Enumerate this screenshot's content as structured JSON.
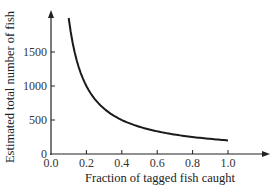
{
  "chart_data": {
    "type": "line",
    "title": "",
    "xlabel": "Fraction of tagged fish caught",
    "ylabel": "Estimated total number of fish",
    "xlim": [
      0.0,
      1.0
    ],
    "ylim": [
      0,
      2000
    ],
    "x_ticks": [
      "0.0",
      "0.2",
      "0.4",
      "0.6",
      "0.8",
      "1.0"
    ],
    "y_ticks": [
      "0",
      "500",
      "1000",
      "1500"
    ],
    "grid": false,
    "legend": null,
    "series": [
      {
        "name": "Estimated total number of fish",
        "x": [
          0.1,
          0.125,
          0.15,
          0.2,
          0.25,
          0.3,
          0.4,
          0.5,
          0.6,
          0.7,
          0.8,
          0.9,
          1.0
        ],
        "y": [
          2000,
          1600,
          1333,
          1000,
          800,
          667,
          500,
          400,
          333,
          286,
          250,
          222,
          200
        ]
      }
    ]
  }
}
